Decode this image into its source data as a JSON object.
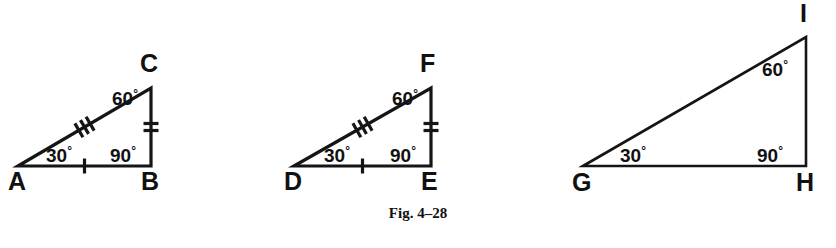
{
  "figure": {
    "caption": "Fig. 4–28",
    "background_color": "#ffffff",
    "ink_color": "#151515",
    "degree_symbol": "°",
    "triangles": [
      {
        "id": "abc",
        "name": "triangle-abc",
        "vertices": {
          "left": {
            "label": "A",
            "x": 18,
            "y": 166
          },
          "right": {
            "label": "B",
            "x": 151,
            "y": 166
          },
          "apex": {
            "label": "C",
            "x": 151,
            "y": 88
          }
        },
        "vertex_label_positions": {
          "left": {
            "x": 8,
            "y": 190
          },
          "right": {
            "x": 141,
            "y": 190
          },
          "apex": {
            "x": 140,
            "y": 72
          }
        },
        "angles": [
          {
            "name": "angle-a",
            "value": "30",
            "x": 46,
            "y": 162
          },
          {
            "name": "angle-b",
            "value": "90",
            "x": 110,
            "y": 162
          },
          {
            "name": "angle-c",
            "value": "60",
            "x": 112,
            "y": 105
          }
        ],
        "ticks": {
          "hypotenuse": 3,
          "vertical_leg": 2,
          "base": 1
        },
        "stroke_width": 3.2
      },
      {
        "id": "def",
        "name": "triangle-def",
        "vertices": {
          "left": {
            "label": "D",
            "x": 294,
            "y": 166
          },
          "right": {
            "label": "E",
            "x": 431,
            "y": 166
          },
          "apex": {
            "label": "F",
            "x": 431,
            "y": 88
          }
        },
        "vertex_label_positions": {
          "left": {
            "x": 284,
            "y": 190
          },
          "right": {
            "x": 421,
            "y": 190
          },
          "apex": {
            "x": 420,
            "y": 72
          }
        },
        "angles": [
          {
            "name": "angle-d",
            "value": "30",
            "x": 324,
            "y": 162
          },
          {
            "name": "angle-e",
            "value": "90",
            "x": 390,
            "y": 162
          },
          {
            "name": "angle-f",
            "value": "60",
            "x": 392,
            "y": 105
          }
        ],
        "ticks": {
          "hypotenuse": 3,
          "vertical_leg": 2,
          "base": 1
        },
        "stroke_width": 3.2
      },
      {
        "id": "ghi",
        "name": "triangle-ghi",
        "vertices": {
          "left": {
            "label": "G",
            "x": 583,
            "y": 166
          },
          "right": {
            "label": "H",
            "x": 806,
            "y": 166
          },
          "apex": {
            "label": "I",
            "x": 806,
            "y": 37
          }
        },
        "vertex_label_positions": {
          "left": {
            "x": 572,
            "y": 191
          },
          "right": {
            "x": 796,
            "y": 191
          },
          "apex": {
            "x": 800,
            "y": 22
          }
        },
        "angles": [
          {
            "name": "angle-g",
            "value": "30",
            "x": 620,
            "y": 162
          },
          {
            "name": "angle-h",
            "value": "90",
            "x": 757,
            "y": 162
          },
          {
            "name": "angle-i",
            "value": "60",
            "x": 762,
            "y": 76
          }
        ],
        "ticks": {
          "hypotenuse": 0,
          "vertical_leg": 0,
          "base": 0
        },
        "stroke_width": 2.6
      }
    ],
    "caption_position": {
      "x": 418,
      "y": 218
    }
  }
}
